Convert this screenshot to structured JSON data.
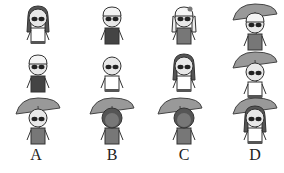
{
  "options": [
    {
      "label": "A",
      "figures": [
        "girl-long-hair",
        "boy-cap-dark-shirt",
        "umbrella-girl-braids"
      ]
    },
    {
      "label": "B",
      "figures": [
        "boy-cap-dark-shirt",
        "bald-boy-white-shirt",
        "umbrella-curly-hair"
      ]
    },
    {
      "label": "C",
      "figures": [
        "girl-pigtails-bow",
        "girl-long-hair-dark",
        "umbrella-curly-hair"
      ]
    },
    {
      "label": "D",
      "figures": [
        "umbrella-girl-bow",
        "umbrella-bald-boy",
        "umbrella-girl-long-hair"
      ]
    }
  ],
  "colors": {
    "ink": "#333333",
    "dark": "#444444",
    "mid": "#888888",
    "light": "#bbbbbb",
    "skin": "#dddddd"
  }
}
